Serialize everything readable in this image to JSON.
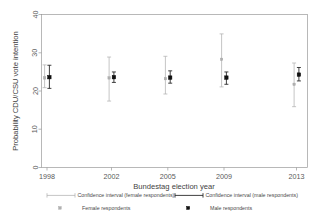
{
  "chart_data": {
    "type": "scatter",
    "title": "",
    "xlabel": "Bundestag election year",
    "ylabel": "Probability CDU/CSU vote intention",
    "categories": [
      "1998",
      "2002",
      "2005",
      "2009",
      "2013"
    ],
    "x_tick_labels": [
      "1998",
      "2002",
      "2005",
      "2009",
      "2013"
    ],
    "y_tick_labels": [
      "0",
      "10",
      "20",
      "30",
      "40"
    ],
    "y_ticks": [
      0,
      10,
      20,
      30,
      40
    ],
    "ylim": [
      0,
      41
    ],
    "grid": false,
    "legend_position": "bottom",
    "series": [
      {
        "name": "Female respondents",
        "marker": "open-square-gray",
        "color": "#b0b0b0",
        "values": [
          24.0,
          24.0,
          23.8,
          29.0,
          22.3
        ],
        "ci_low": [
          21.4,
          17.8,
          19.7,
          21.6,
          16.3
        ],
        "ci_high": [
          27.5,
          29.6,
          29.8,
          35.8,
          28.0
        ]
      },
      {
        "name": "Male respondents",
        "marker": "filled-square-black",
        "color": "#111111",
        "values": [
          24.2,
          24.2,
          24.1,
          24.1,
          24.9
        ],
        "ci_low": [
          21.2,
          22.8,
          22.6,
          22.3,
          23.2
        ],
        "ci_high": [
          27.4,
          25.6,
          25.9,
          25.6,
          26.8
        ]
      }
    ],
    "legend": [
      {
        "key": "ci-female",
        "label": "Confidence interval (female respondents)",
        "glyph": "line-gray"
      },
      {
        "key": "ci-male",
        "label": "Confidence interval (male respondents)",
        "glyph": "line-black"
      },
      {
        "key": "pt-female",
        "label": "Female respondents",
        "glyph": "square-gray"
      },
      {
        "key": "pt-male",
        "label": "Male respondents",
        "glyph": "square-black"
      }
    ]
  },
  "colors": {
    "female": "#b0b0b0",
    "male": "#111111",
    "frame": "#9a9a9a",
    "background": "#ffffff"
  }
}
